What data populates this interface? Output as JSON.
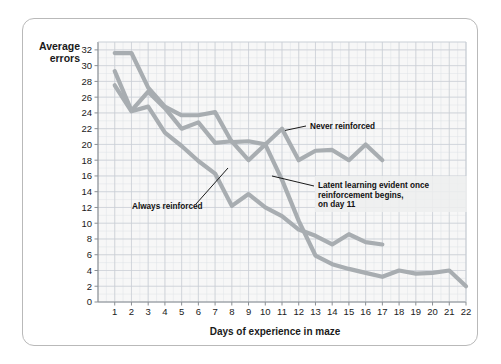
{
  "figure": {
    "y_axis_title_line1": "Average",
    "y_axis_title_line2": "errors",
    "x_axis_title": "Days of experience in maze",
    "frame_color": "#b9b9b9",
    "grid_color": "#c8cdd4",
    "plot_bg": "#f7f7f7"
  },
  "annotations": {
    "never_reinforced": "Never reinforced",
    "always_reinforced": "Always reinforced",
    "latent_line1": "Latent learning evident once",
    "latent_line2": "reinforcement begins,",
    "latent_line3": "on day 11"
  },
  "chart_data": {
    "type": "line",
    "title": "",
    "xlabel": "Days of experience in maze",
    "ylabel": "Average errors",
    "xlim": [
      0,
      22
    ],
    "ylim": [
      0,
      33
    ],
    "xticks": [
      1,
      2,
      3,
      4,
      5,
      6,
      7,
      8,
      9,
      10,
      11,
      12,
      13,
      14,
      15,
      16,
      17,
      18,
      19,
      20,
      21,
      22
    ],
    "yticks": [
      0,
      2,
      4,
      6,
      8,
      10,
      12,
      14,
      16,
      18,
      20,
      22,
      24,
      26,
      28,
      30,
      32
    ],
    "grid": true,
    "legend_position": "inline-annotations",
    "line_color": "#9fa4a8",
    "series": [
      {
        "name": "Never reinforced",
        "color": "#a8adb1",
        "x": [
          1,
          2,
          3,
          4,
          5,
          6,
          7,
          8,
          9,
          10,
          11,
          12,
          13,
          14,
          15,
          16,
          17
        ],
        "values": [
          31.6,
          31.6,
          27.2,
          24.8,
          23.7,
          23.7,
          24.1,
          20.3,
          20.4,
          20.0,
          22.0,
          18.0,
          19.2,
          19.3,
          18.0,
          20.0,
          18.0
        ]
      },
      {
        "name": "Latent learning (reinforcement begins day 11)",
        "color": "#a8adb1",
        "x": [
          1,
          2,
          3,
          4,
          5,
          6,
          7,
          8,
          9,
          10,
          11,
          12,
          13,
          14,
          15,
          16,
          17,
          18,
          19,
          20,
          21,
          22
        ],
        "values": [
          29.3,
          24.3,
          26.7,
          24.6,
          22.0,
          22.8,
          20.2,
          20.4,
          18.0,
          20.0,
          15.5,
          10.3,
          5.9,
          4.8,
          4.2,
          3.7,
          3.2,
          4.0,
          3.6,
          3.7,
          4.0,
          2.0
        ]
      },
      {
        "name": "Always reinforced",
        "color": "#a8adb1",
        "x": [
          1,
          2,
          3,
          4,
          5,
          6,
          7,
          8,
          9,
          10,
          11,
          12,
          13,
          14,
          15,
          16,
          17
        ],
        "values": [
          27.5,
          24.2,
          24.8,
          21.5,
          19.8,
          17.9,
          16.3,
          12.2,
          13.7,
          12.0,
          10.9,
          9.2,
          8.4,
          7.3,
          8.6,
          7.6,
          7.3
        ]
      }
    ]
  }
}
